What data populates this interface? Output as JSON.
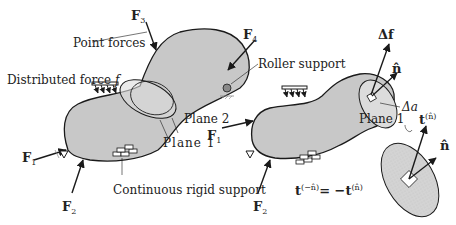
{
  "labels": {
    "point_forces": "Point forces",
    "distributed_force": "Distributed force",
    "distributed_force_symbol": "f",
    "roller_support": "Roller support",
    "plane2": "Plane 2",
    "plane1_left": "Plane 1",
    "plane1_right": "Plane 1",
    "continuous_support": "Continuous rigid support",
    "delta_f": "Δf",
    "n_hat_top": "n̂",
    "delta_a": "Δa",
    "n_hat_bottom": "n̂",
    "equation": "t⁽⁻ⁿ̂⁾ = −t⁽ⁿ̂⁾"
  },
  "forces": {
    "F1": {
      "base": "F",
      "sub": "1"
    },
    "F2": {
      "base": "F",
      "sub": "2"
    },
    "F3": {
      "base": "F",
      "sub": "3"
    },
    "F4": {
      "base": "F",
      "sub": "4"
    },
    "F1_right": {
      "base": "F",
      "sub": "1"
    },
    "F2_right": {
      "base": "F",
      "sub": "2"
    }
  },
  "traction": {
    "base": "t",
    "sup": "(n̂)"
  },
  "equation_parts": {
    "lhs": "t",
    "lhs_sup": "(−n̂)",
    "eq": "= −t",
    "rhs_sup": "(n̂)"
  },
  "colors": {
    "body_fill": "#c8c8c8",
    "stroke": "#1a1a1a",
    "roller": "#8a8a8a"
  }
}
